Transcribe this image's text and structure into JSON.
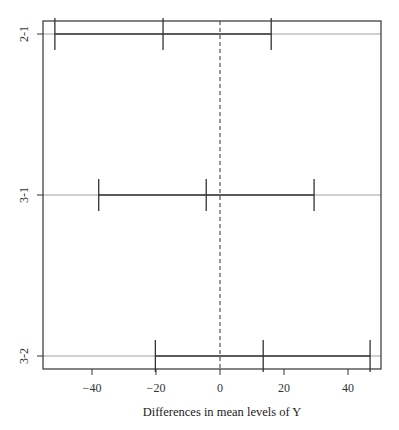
{
  "chart_data": {
    "type": "errorbar",
    "title": "",
    "xlabel": "Differences in mean levels of Y",
    "ylabel": "",
    "xlim": [
      -55,
      50
    ],
    "x_ticks": [
      -40,
      -20,
      0,
      20,
      40
    ],
    "x_tick_labels": [
      "−40",
      "−20",
      "0",
      "20",
      "40"
    ],
    "reference_line": {
      "x": 0,
      "style": "dashed"
    },
    "grid": false,
    "legend": null,
    "comparisons": [
      {
        "label": "2-1",
        "lower": -51.6,
        "diff": -17.8,
        "upper": 16.0
      },
      {
        "label": "3-1",
        "lower": -37.9,
        "diff": -4.3,
        "upper": 29.4
      },
      {
        "label": "3-2",
        "lower": -20.2,
        "diff": 13.5,
        "upper": 46.9
      }
    ]
  },
  "colors": {
    "axis": "#333333",
    "interval": "#333333",
    "row_guide": "#a0a0a0",
    "zero_line": "#333333"
  }
}
